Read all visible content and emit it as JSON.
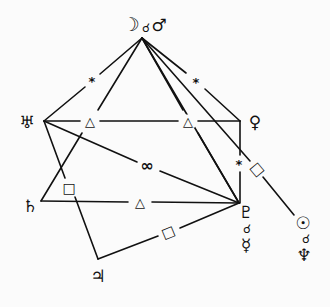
{
  "diagram": {
    "type": "astrological-aspect-chart",
    "line_color": "#111111",
    "background": "#fbfbfb"
  },
  "planets": {
    "moon": {
      "symbol": "☽",
      "name": "Moon"
    },
    "mars": {
      "symbol": "♂",
      "name": "Mars"
    },
    "moon_mars_conj": {
      "symbol": "☌"
    },
    "uranus": {
      "symbol": "♅",
      "name": "Uranus"
    },
    "venus": {
      "symbol": "♀",
      "name": "Venus"
    },
    "saturn": {
      "symbol": "♄",
      "name": "Saturn"
    },
    "pluto": {
      "symbol": "♇",
      "name": "Pluto"
    },
    "pluto_mercury_conj": {
      "symbol": "☌"
    },
    "mercury": {
      "symbol": "☿",
      "name": "Mercury"
    },
    "jupiter": {
      "symbol": "♃",
      "name": "Jupiter"
    },
    "sun": {
      "symbol": "☉",
      "name": "Sun"
    },
    "sun_neptune_conj": {
      "symbol": "☌"
    },
    "neptune": {
      "symbol": "♆",
      "name": "Neptune"
    }
  },
  "aspects": {
    "moon_uranus": {
      "symbol": "*",
      "type": "sextile"
    },
    "moon_venus": {
      "symbol": "*",
      "type": "sextile"
    },
    "uranus_venus_1": {
      "symbol": "△",
      "type": "trine"
    },
    "uranus_venus_2": {
      "symbol": "△",
      "type": "trine"
    },
    "uranus_pluto": {
      "symbol": "∞",
      "type": "opposition"
    },
    "uranus_jupiter": {
      "symbol": "□",
      "type": "square"
    },
    "venus_pluto": {
      "symbol": "*",
      "type": "sextile"
    },
    "moon_sun": {
      "symbol": "□",
      "type": "square"
    },
    "saturn_pluto": {
      "symbol": "△",
      "type": "trine"
    },
    "jupiter_pluto": {
      "symbol": "□",
      "type": "square"
    }
  }
}
